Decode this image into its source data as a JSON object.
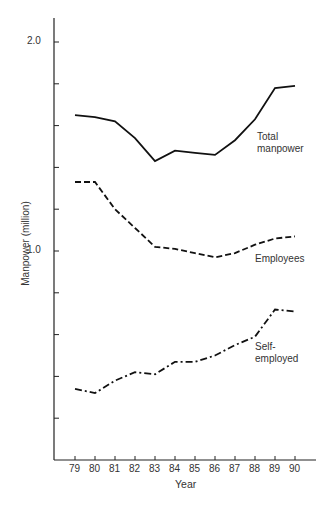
{
  "chart_data": {
    "type": "line",
    "title": "",
    "xlabel": "Year",
    "ylabel": "Manpower (million)",
    "x": [
      "79",
      "80",
      "81",
      "82",
      "83",
      "84",
      "85",
      "86",
      "87",
      "88",
      "89",
      "90"
    ],
    "ylim": [
      0,
      2.0
    ],
    "yticks_labeled": [
      "2.0",
      "1.0"
    ],
    "ytick_step": 0.2,
    "grid": false,
    "legend": "inline labels at right",
    "series": [
      {
        "name": "Total manpower",
        "label_lines": [
          "Total",
          "manpower"
        ],
        "style": "solid",
        "values": [
          1.65,
          1.64,
          1.62,
          1.54,
          1.43,
          1.48,
          1.47,
          1.46,
          1.53,
          1.63,
          1.78,
          1.79
        ]
      },
      {
        "name": "Employees",
        "label_lines": [
          "Employees"
        ],
        "style": "dashed",
        "values": [
          1.33,
          1.33,
          1.2,
          1.11,
          1.02,
          1.01,
          0.99,
          0.97,
          0.99,
          1.03,
          1.06,
          1.07
        ]
      },
      {
        "name": "Self-employed",
        "label_lines": [
          "Self-",
          "employed"
        ],
        "style": "dashdot",
        "values": [
          0.34,
          0.32,
          0.38,
          0.42,
          0.41,
          0.47,
          0.47,
          0.5,
          0.55,
          0.59,
          0.72,
          0.71
        ]
      }
    ]
  }
}
